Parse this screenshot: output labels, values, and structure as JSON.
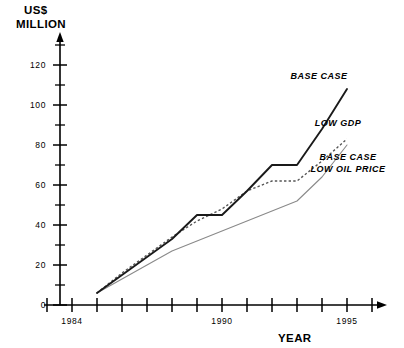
{
  "chart_data": {
    "type": "line",
    "title": "",
    "ylabel": "US$ MILLION",
    "xlabel": "YEAR",
    "ylim": [
      0,
      130
    ],
    "xlim": [
      1983,
      1996
    ],
    "grid": false,
    "legend_position": "inline-right-of-curves",
    "y_major_ticks": [
      0,
      20,
      40,
      60,
      80,
      100,
      120
    ],
    "y_minor_ticks": [
      10,
      30,
      50,
      70,
      90,
      110,
      130
    ],
    "y_tick_labels": [
      "0",
      "20",
      "40",
      "60",
      "80",
      "100",
      "120"
    ],
    "x_ticks": [
      1983,
      1984,
      1985,
      1986,
      1987,
      1988,
      1989,
      1990,
      1991,
      1992,
      1993,
      1994,
      1995,
      1996
    ],
    "x_tick_labels": [
      {
        "year": 1984,
        "label": "1984"
      },
      {
        "year": 1990,
        "label": "1990"
      },
      {
        "year": 1995,
        "label": "1995"
      }
    ],
    "x": [
      1985,
      1986,
      1987,
      1988,
      1989,
      1990,
      1991,
      1992,
      1993,
      1994,
      1995
    ],
    "series": [
      {
        "name": "BASE CASE",
        "style": "solid-thick",
        "values": [
          6,
          15,
          24,
          33,
          45,
          45,
          57,
          70,
          70,
          88,
          108
        ],
        "label": "BASE CASE",
        "label_year": 1994.1,
        "label_value": 122
      },
      {
        "name": "LOW GDP",
        "style": "solid-thin",
        "values": [
          6,
          13,
          20,
          27,
          32,
          37,
          42,
          47,
          52,
          64,
          80
        ],
        "label": "LOW GDP",
        "label_year": 1992.9,
        "label_value": 100
      },
      {
        "name": "BASE CASE LOW OIL PRICE",
        "style": "dotted",
        "values": [
          6,
          16,
          25,
          34,
          42,
          48,
          57,
          62,
          62,
          72,
          83
        ],
        "label_line_1": "BASE CASE",
        "label_line_2": "LOW OIL PRICE",
        "label_year": 1993.2,
        "label_value": 82
      }
    ]
  },
  "labels": {
    "y_axis_title_line_1": "US$",
    "y_axis_title_line_2": "MILLION",
    "x_axis_title": "YEAR",
    "series_base_case": "BASE CASE",
    "series_low_gdp": "LOW GDP",
    "series_low_oil_line_1": "BASE CASE",
    "series_low_oil_line_2": "LOW OIL PRICE",
    "tick_1984": "1984",
    "tick_1990": "1990",
    "tick_1995": "1995",
    "tick_0": "0",
    "tick_20": "20",
    "tick_40": "40",
    "tick_60": "60",
    "tick_80": "80",
    "tick_100": "100",
    "tick_120": "120"
  },
  "colors": {
    "axis": "#000000",
    "base_case": "#1a1a1a",
    "low_oil_price": "#555555",
    "low_gdp": "#8a8a8a",
    "background": "#ffffff"
  }
}
